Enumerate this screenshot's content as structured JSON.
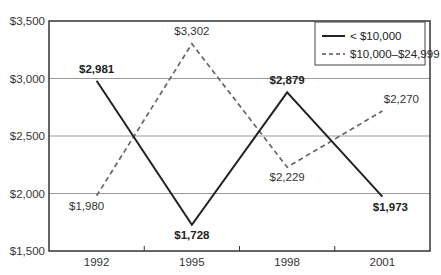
{
  "chart_data": {
    "type": "line",
    "title": "",
    "xlabel": "",
    "ylabel": "",
    "categories": [
      "1992",
      "1995",
      "1998",
      "2001"
    ],
    "ylim": [
      1500,
      3500
    ],
    "yticks": [
      1500,
      2000,
      2500,
      3000,
      3500
    ],
    "ytick_labels": [
      "$1,500",
      "$2,000",
      "$2,500",
      "$3,000",
      "$3,500"
    ],
    "grid": "horizontal",
    "legend_position": "upper right",
    "series": [
      {
        "name": "< $10,000",
        "style": "solid",
        "color": "#222222",
        "values": [
          2981,
          1728,
          2879,
          1973
        ],
        "labels": [
          "$2,981",
          "$1,728",
          "$2,879",
          "$1,973"
        ]
      },
      {
        "name": "$10,000–$24,999",
        "style": "dashed",
        "color": "#666666",
        "values": [
          1980,
          3302,
          2229,
          2270
        ],
        "labels": [
          "$1,980",
          "$3,302",
          "$2,229",
          "$2,270"
        ]
      }
    ]
  },
  "legend": {
    "items": [
      "< $10,000",
      "$10,000–$24,999"
    ]
  }
}
